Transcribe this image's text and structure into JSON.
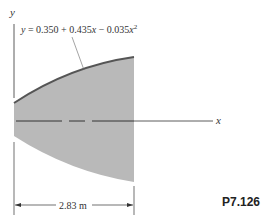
{
  "figure": {
    "problem_id": "P7.126",
    "equation": {
      "prefix": "y = 0.350 + 0.435",
      "x1": "x",
      "mid": " − 0.035",
      "x2": "x",
      "exp": "2"
    },
    "axis_labels": {
      "y": "y",
      "x": "x"
    },
    "dimension": "2.83 m",
    "colors": {
      "fill": "#b8b8b8",
      "curve": "#555555",
      "line": "#333333"
    }
  }
}
